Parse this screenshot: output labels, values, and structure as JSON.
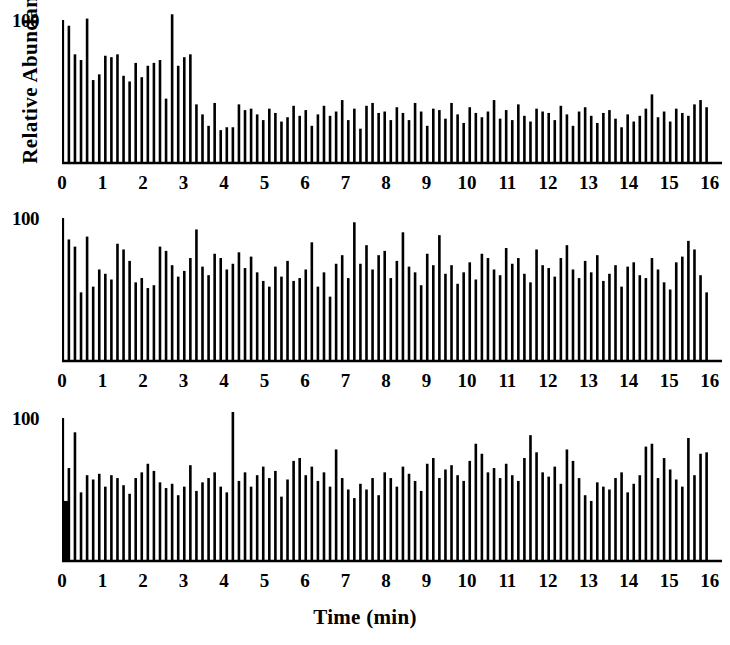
{
  "figure": {
    "ylabel": "Relative Abundance",
    "xlabel": "Time (min)",
    "y_tick_label": "100",
    "x_tick_labels": [
      "0",
      "1",
      "2",
      "3",
      "4",
      "5",
      "6",
      "7",
      "8",
      "9",
      "10",
      "11",
      "12",
      "13",
      "14",
      "15",
      "16"
    ],
    "ink_color": "#000000",
    "background_color": "#ffffff"
  },
  "chart_data": {
    "type": "bar",
    "title": "",
    "subtitle": "",
    "xlabel": "Time (min)",
    "ylabel": "Relative Abundance",
    "xlim": [
      0,
      16.3
    ],
    "ylim": [
      0,
      112
    ],
    "yticks": [
      100
    ],
    "ytick_labels": [
      "100"
    ],
    "xticks": [
      0,
      1,
      2,
      3,
      4,
      5,
      6,
      7,
      8,
      9,
      10,
      11,
      12,
      13,
      14,
      15,
      16
    ],
    "xtick_labels": [
      "0",
      "1",
      "2",
      "3",
      "4",
      "5",
      "6",
      "7",
      "8",
      "9",
      "10",
      "11",
      "12",
      "13",
      "14",
      "15",
      "16"
    ],
    "grid": false,
    "legend": null,
    "annotations": [],
    "peak_spacing_min": 0.15,
    "x_start_min": 0.02,
    "panels": [
      {
        "name": "panel-top",
        "index": 0,
        "values": [
          100,
          96,
          76,
          72,
          101,
          58,
          62,
          75,
          74,
          76,
          61,
          57,
          70,
          60,
          68,
          70,
          72,
          45,
          104,
          68,
          74,
          76,
          41,
          34,
          26,
          42,
          23,
          25,
          25,
          41,
          37,
          38,
          34,
          30,
          38,
          35,
          29,
          32,
          40,
          33,
          37,
          26,
          34,
          40,
          33,
          36,
          44,
          30,
          38,
          24,
          40,
          42,
          35,
          36,
          30,
          39,
          35,
          30,
          42,
          36,
          26,
          38,
          37,
          31,
          42,
          34,
          28,
          39,
          35,
          32,
          36,
          44,
          31,
          37,
          30,
          41,
          33,
          29,
          38,
          36,
          35,
          30,
          40,
          34,
          26,
          36,
          39,
          33,
          28,
          35,
          37,
          31,
          25,
          34,
          29,
          33,
          38,
          48,
          32,
          36,
          29,
          38,
          35,
          33,
          41,
          44,
          39
        ]
      },
      {
        "name": "panel-middle",
        "index": 1,
        "values": [
          100,
          85,
          80,
          48,
          87,
          52,
          64,
          61,
          57,
          82,
          78,
          70,
          55,
          58,
          51,
          53,
          80,
          77,
          67,
          59,
          63,
          72,
          92,
          66,
          60,
          75,
          72,
          64,
          68,
          76,
          65,
          73,
          62,
          56,
          52,
          66,
          59,
          70,
          56,
          58,
          64,
          83,
          52,
          62,
          45,
          68,
          74,
          58,
          97,
          68,
          81,
          64,
          74,
          77,
          58,
          70,
          90,
          66,
          62,
          53,
          75,
          67,
          88,
          61,
          67,
          54,
          62,
          69,
          57,
          75,
          72,
          64,
          60,
          79,
          68,
          72,
          61,
          55,
          78,
          67,
          65,
          59,
          72,
          81,
          64,
          58,
          70,
          62,
          74,
          56,
          61,
          67,
          52,
          66,
          69,
          60,
          58,
          72,
          64,
          55,
          50,
          69,
          73,
          84,
          78,
          60,
          48
        ]
      },
      {
        "name": "panel-bottom",
        "index": 2,
        "values": [
          100,
          65,
          90,
          48,
          60,
          57,
          61,
          52,
          60,
          58,
          53,
          47,
          58,
          62,
          68,
          63,
          55,
          51,
          54,
          46,
          52,
          67,
          49,
          55,
          58,
          62,
          52,
          48,
          105,
          56,
          62,
          52,
          60,
          66,
          58,
          63,
          45,
          57,
          70,
          72,
          60,
          66,
          56,
          62,
          52,
          78,
          58,
          50,
          44,
          54,
          50,
          58,
          46,
          62,
          58,
          52,
          66,
          61,
          56,
          49,
          68,
          72,
          58,
          64,
          67,
          60,
          56,
          70,
          82,
          75,
          62,
          65,
          58,
          68,
          60,
          56,
          72,
          88,
          76,
          62,
          59,
          66,
          54,
          78,
          70,
          58,
          46,
          42,
          55,
          52,
          50,
          58,
          62,
          48,
          54,
          60,
          80,
          82,
          58,
          72,
          64,
          57,
          52,
          86,
          60,
          75,
          76
        ]
      }
    ]
  }
}
